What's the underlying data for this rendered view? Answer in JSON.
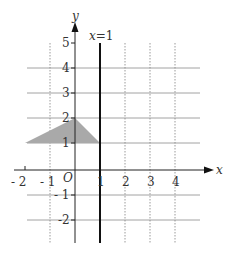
{
  "diagram": {
    "axes": {
      "x_label": "x",
      "y_label": "y",
      "origin_label": "O",
      "x_ticks": [
        "- 2",
        "- 1",
        "1",
        "2",
        "3",
        "4"
      ],
      "y_ticks": [
        "5",
        "4",
        "3",
        "2",
        "1",
        "- 1",
        "-2"
      ]
    },
    "line": {
      "label": "x=1",
      "equation": "x = 1"
    },
    "shaded_triangle": {
      "vertices": [
        [
          -2,
          1
        ],
        [
          0,
          2
        ],
        [
          1,
          1
        ]
      ],
      "color": "#aaaaaa"
    },
    "colors": {
      "grid": "#999999",
      "axis": "#222222",
      "line": "#111111"
    }
  }
}
